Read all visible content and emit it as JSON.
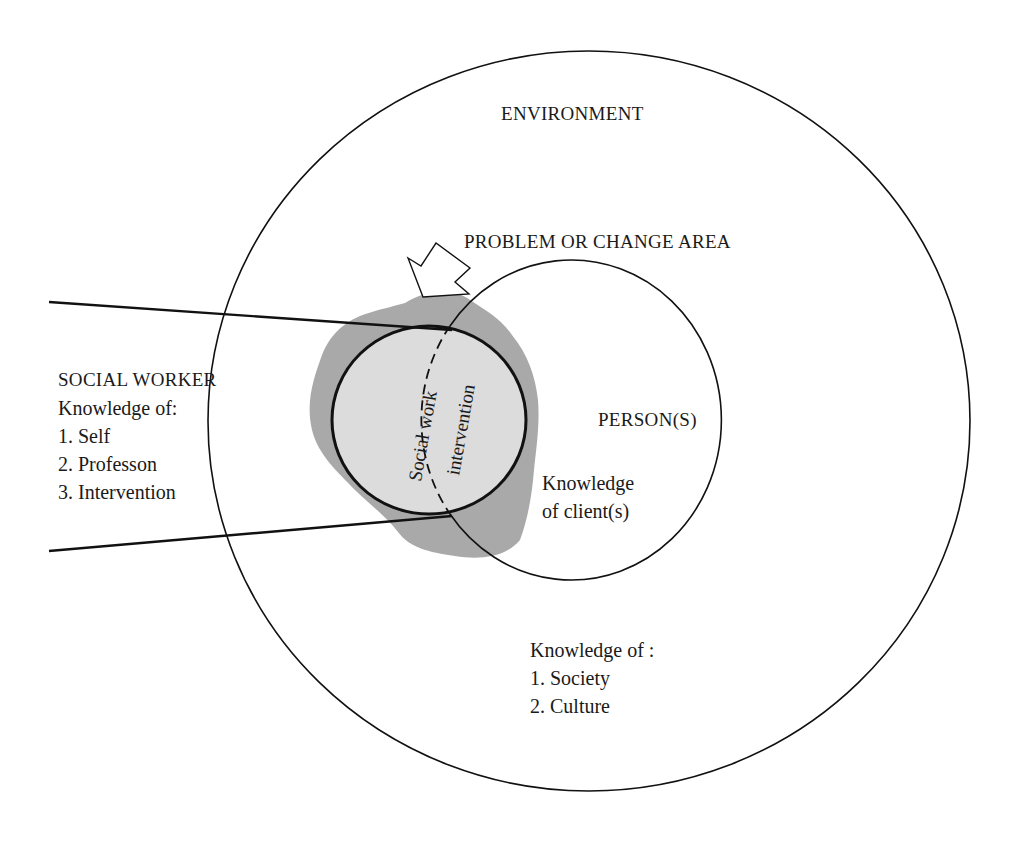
{
  "diagram": {
    "type": "nested-circle-model",
    "colors": {
      "stroke": "#111111",
      "shaded_blob": "#a9a9a9",
      "inner_circle_fill": "#dcdcdc",
      "background": "#ffffff"
    },
    "environment": {
      "title": "ENVIRONMENT",
      "knowledge_heading": "Knowledge of :",
      "knowledge_items": [
        "1. Society",
        "2. Culture"
      ]
    },
    "problem_area": {
      "title": "PROBLEM OR CHANGE AREA",
      "arrow_icon": "hollow-arrow-pointing-down-left"
    },
    "person": {
      "title": "PERSON(S)",
      "knowledge_line1": "Knowledge",
      "knowledge_line2": "of client(s)"
    },
    "social_worker": {
      "title": "SOCIAL WORKER",
      "knowledge_heading": "Knowledge of:",
      "knowledge_items": [
        "1. Self",
        "2. Professon",
        "3. Intervention"
      ]
    },
    "intervention": {
      "line1": "Social work",
      "line2": "intervention"
    }
  }
}
